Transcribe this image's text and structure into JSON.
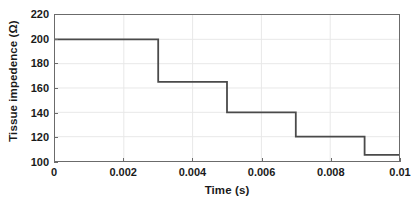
{
  "chart_data": {
    "type": "line",
    "subtype": "step-post",
    "title": "",
    "xlabel": "Time (s)",
    "ylabel": "Tissue impedence (Ω)",
    "xlim": [
      0,
      0.01
    ],
    "ylim": [
      100,
      220
    ],
    "xticks": [
      0,
      0.002,
      0.004,
      0.006,
      0.008,
      0.01
    ],
    "xtick_labels": [
      "0",
      "0.002",
      "0.004",
      "0.006",
      "0.008",
      "0.01"
    ],
    "yticks": [
      100,
      120,
      140,
      160,
      180,
      200,
      220
    ],
    "ytick_labels": [
      "100",
      "120",
      "140",
      "160",
      "180",
      "200",
      "220"
    ],
    "grid": true,
    "legend": null,
    "series": [
      {
        "name": "Tissue impedence",
        "color": "#4a4a4a",
        "line_width": 1.8,
        "x": [
          0,
          0.003,
          0.005,
          0.007,
          0.009,
          0.01
        ],
        "y": [
          200,
          165,
          140,
          120,
          105,
          105
        ],
        "steps": [
          {
            "x_start": 0,
            "x_end": 0.003,
            "value": 200
          },
          {
            "x_start": 0.003,
            "x_end": 0.005,
            "value": 165
          },
          {
            "x_start": 0.005,
            "x_end": 0.007,
            "value": 140
          },
          {
            "x_start": 0.007,
            "x_end": 0.009,
            "value": 120
          },
          {
            "x_start": 0.009,
            "x_end": 0.01,
            "value": 105
          }
        ]
      }
    ],
    "colors": {
      "background": "#ffffff",
      "axis": "#6b6b6b",
      "grid": "#e8e8e8",
      "text": "#1a1a1a",
      "series": "#4a4a4a"
    }
  }
}
